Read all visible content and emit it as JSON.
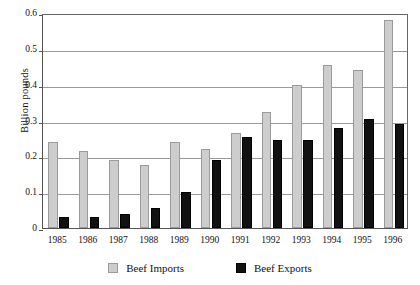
{
  "chart_data": {
    "type": "bar",
    "title": "",
    "xlabel": "",
    "ylabel": "Billion pounds",
    "ylim": [
      0,
      0.6
    ],
    "ytick_labels": [
      "0.6",
      "0.5",
      "0.4",
      "0.3",
      "0.2",
      "0.1",
      "0"
    ],
    "ytick_values": [
      0.6,
      0.5,
      0.4,
      0.3,
      0.2,
      0.1,
      0
    ],
    "grid": true,
    "legend_position": "bottom",
    "categories": [
      "1985",
      "1986",
      "1987",
      "1988",
      "1989",
      "1990",
      "1991",
      "1992",
      "1993",
      "1994",
      "1995",
      "1996"
    ],
    "series": [
      {
        "name": "Beef Imports",
        "color": "#cdcdcd",
        "values": [
          0.24,
          0.215,
          0.19,
          0.175,
          0.24,
          0.22,
          0.265,
          0.325,
          0.4,
          0.455,
          0.44,
          0.58
        ]
      },
      {
        "name": "Beef Exports",
        "color": "#111111",
        "values": [
          0.03,
          0.03,
          0.04,
          0.055,
          0.1,
          0.19,
          0.255,
          0.245,
          0.245,
          0.28,
          0.305,
          0.29
        ]
      }
    ]
  },
  "legend": {
    "entries": [
      {
        "label": "Beef Imports",
        "swatch": "imports"
      },
      {
        "label": "Beef Exports",
        "swatch": "exports"
      }
    ]
  }
}
